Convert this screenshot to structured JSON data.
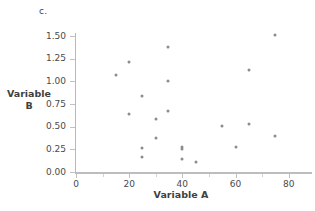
{
  "figure": {
    "panel_label": "c.",
    "y_axis_title_line1": "Variable",
    "y_axis_title_line2": "B",
    "x_axis_title": "Variable A",
    "point_color": "#8c8c8c",
    "axis_color": "#bdbdbd"
  },
  "chart_data": {
    "type": "scatter",
    "title": "c.",
    "xlabel": "Variable A",
    "ylabel": "Variable B",
    "xlim": [
      0,
      85
    ],
    "ylim": [
      0.0,
      1.5
    ],
    "xticks": [
      0,
      20,
      40,
      60,
      80
    ],
    "xtick_labels": [
      "0",
      "20",
      "40",
      "60",
      "80"
    ],
    "yticks": [
      0.0,
      0.25,
      0.5,
      0.75,
      1.0,
      1.25,
      1.5
    ],
    "ytick_labels": [
      "0.00",
      "0.25",
      "0.50",
      "0.75",
      "1.00",
      "1.25",
      "1.50"
    ],
    "grid": false,
    "legend": null,
    "series": [
      {
        "name": "data",
        "marker": "circle",
        "color": "#8c8c8c",
        "points": [
          {
            "x": 15,
            "y": 1.07
          },
          {
            "x": 20,
            "y": 1.21
          },
          {
            "x": 20,
            "y": 0.64
          },
          {
            "x": 25,
            "y": 0.84
          },
          {
            "x": 25,
            "y": 0.27
          },
          {
            "x": 25,
            "y": 0.17
          },
          {
            "x": 30,
            "y": 0.58
          },
          {
            "x": 30,
            "y": 0.37
          },
          {
            "x": 34.5,
            "y": 1.38
          },
          {
            "x": 34.5,
            "y": 1.0
          },
          {
            "x": 34.5,
            "y": 0.67
          },
          {
            "x": 40,
            "y": 0.28
          },
          {
            "x": 40,
            "y": 0.25
          },
          {
            "x": 40,
            "y": 0.14
          },
          {
            "x": 45,
            "y": 0.11
          },
          {
            "x": 55,
            "y": 0.51
          },
          {
            "x": 60,
            "y": 0.28
          },
          {
            "x": 65,
            "y": 1.13
          },
          {
            "x": 65,
            "y": 0.53
          },
          {
            "x": 75,
            "y": 1.51
          },
          {
            "x": 75,
            "y": 0.4
          }
        ]
      }
    ]
  }
}
